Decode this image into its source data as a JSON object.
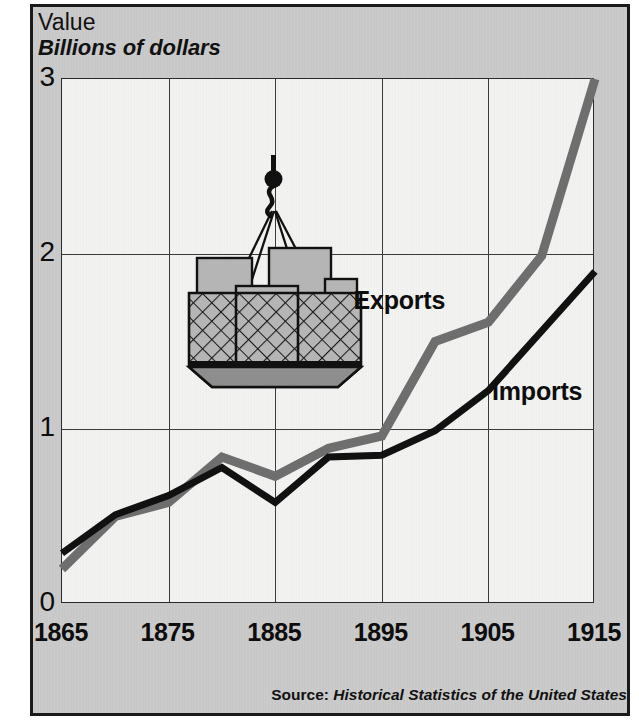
{
  "figure": {
    "axis_title_line1": "Value",
    "axis_title_line2": "Billions of dollars",
    "source_prefix": "Source:",
    "source_title": "Historical Statistics of the United States",
    "illustration_name": "crane-cargo-net-illustration"
  },
  "chart_data": {
    "type": "line",
    "title": "Value",
    "subtitle": "Billions of dollars",
    "xlabel": "",
    "ylabel": "Billions of dollars",
    "xlim": [
      1865,
      1915
    ],
    "ylim": [
      0,
      3
    ],
    "xticks": [
      1865,
      1875,
      1885,
      1895,
      1905,
      1915
    ],
    "xticklabels": [
      "1865",
      "1875",
      "1885",
      "1895",
      "1905",
      "1915"
    ],
    "yticks": [
      0,
      1,
      2,
      3
    ],
    "yticklabels": [
      "0",
      "1",
      "2",
      "3"
    ],
    "grid": true,
    "legend_position": "inline-annotation",
    "x": [
      1865,
      1870,
      1875,
      1880,
      1885,
      1890,
      1895,
      1900,
      1905,
      1910,
      1915
    ],
    "series": [
      {
        "name": "Exports",
        "color": "#6e6e6e",
        "values": [
          0.2,
          0.5,
          0.58,
          0.84,
          0.73,
          0.89,
          0.96,
          1.5,
          1.61,
          1.99,
          3.0
        ]
      },
      {
        "name": "Imports",
        "color": "#111111",
        "values": [
          0.29,
          0.51,
          0.62,
          0.78,
          0.58,
          0.84,
          0.85,
          0.99,
          1.22,
          1.56,
          1.9
        ]
      }
    ],
    "annotations": [
      {
        "text": "Exports",
        "x": 1893,
        "y": 1.72
      },
      {
        "text": "Imports",
        "x": 1906,
        "y": 1.2
      }
    ],
    "source": "Source: Historical Statistics of the United States"
  },
  "colors": {
    "exports": "#6e6e6e",
    "imports": "#111111",
    "panel": "#c9c9c9",
    "plot": "#f3f3f1",
    "frame": "#1a1a1a",
    "grid": "#3a3a3a"
  }
}
